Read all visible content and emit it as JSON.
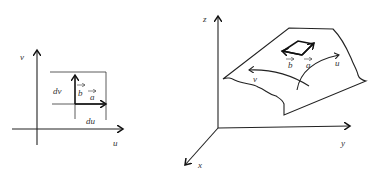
{
  "left_figure": {
    "title": "parameter plane",
    "axis_labels": {
      "vertical": "v",
      "horizontal": "u"
    },
    "dimension_labels": {
      "dv": "dv",
      "du": "du"
    },
    "vectors": {
      "a": "a",
      "b": "b"
    }
  },
  "right_figure": {
    "title": "surface in 3D space",
    "axis_labels": {
      "z": "z",
      "y": "y",
      "x": "x"
    },
    "curve_labels": {
      "u": "u",
      "v": "v"
    },
    "vectors": {
      "a": "a",
      "b": "b"
    }
  },
  "colors": {
    "ink": "#222222",
    "background": "#ffffff"
  }
}
